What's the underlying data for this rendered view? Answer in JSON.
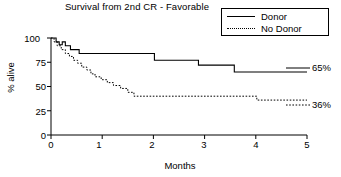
{
  "chart_data": {
    "type": "line",
    "title": "Survival from 2nd CR - Favorable",
    "xlabel": "Months",
    "ylabel": "% alive",
    "xlim": [
      0,
      5
    ],
    "ylim": [
      0,
      100
    ],
    "xticks": [
      "0",
      "1",
      "2",
      "3",
      "4",
      "5"
    ],
    "yticks": [
      "0",
      "25",
      "50",
      "75",
      "100"
    ],
    "grid": false,
    "legend_position": "top-right",
    "series": [
      {
        "name": "Donor",
        "style": "solid",
        "end_label": "65%",
        "points": [
          [
            0.0,
            100
          ],
          [
            0.1,
            100
          ],
          [
            0.1,
            96
          ],
          [
            0.16,
            96
          ],
          [
            0.16,
            93
          ],
          [
            0.22,
            93
          ],
          [
            0.22,
            96
          ],
          [
            0.28,
            96
          ],
          [
            0.28,
            92
          ],
          [
            0.38,
            92
          ],
          [
            0.38,
            88
          ],
          [
            0.55,
            88
          ],
          [
            0.55,
            84
          ],
          [
            2.02,
            84
          ],
          [
            2.02,
            77
          ],
          [
            2.88,
            77
          ],
          [
            2.88,
            72
          ],
          [
            3.58,
            72
          ],
          [
            3.58,
            65
          ],
          [
            5.0,
            65
          ]
        ]
      },
      {
        "name": "No Donor",
        "style": "dotted",
        "end_label": "36%",
        "points": [
          [
            0.0,
            100
          ],
          [
            0.06,
            100
          ],
          [
            0.06,
            96
          ],
          [
            0.12,
            96
          ],
          [
            0.12,
            92
          ],
          [
            0.2,
            92
          ],
          [
            0.2,
            88
          ],
          [
            0.28,
            88
          ],
          [
            0.28,
            84
          ],
          [
            0.36,
            84
          ],
          [
            0.36,
            81
          ],
          [
            0.44,
            81
          ],
          [
            0.44,
            77
          ],
          [
            0.52,
            77
          ],
          [
            0.52,
            74
          ],
          [
            0.6,
            74
          ],
          [
            0.6,
            70
          ],
          [
            0.7,
            70
          ],
          [
            0.7,
            67
          ],
          [
            0.78,
            67
          ],
          [
            0.78,
            63
          ],
          [
            0.86,
            63
          ],
          [
            0.86,
            60
          ],
          [
            0.98,
            60
          ],
          [
            0.98,
            57
          ],
          [
            1.1,
            57
          ],
          [
            1.1,
            54
          ],
          [
            1.22,
            54
          ],
          [
            1.22,
            51
          ],
          [
            1.36,
            51
          ],
          [
            1.36,
            48
          ],
          [
            1.5,
            48
          ],
          [
            1.5,
            44
          ],
          [
            1.62,
            44
          ],
          [
            1.62,
            40
          ],
          [
            4.02,
            40
          ],
          [
            4.02,
            36
          ],
          [
            5.0,
            36
          ]
        ]
      }
    ],
    "legend": [
      {
        "label": "Donor",
        "style": "solid"
      },
      {
        "label": "No Donor",
        "style": "dotted"
      }
    ]
  },
  "axes": {
    "plot_left_px": 51,
    "plot_right_px": 307,
    "plot_top_px": 38,
    "plot_bottom_px": 135
  }
}
